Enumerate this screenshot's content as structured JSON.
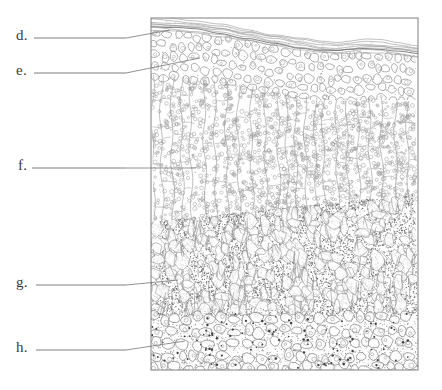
{
  "figure": {
    "background_color": "#ffffff",
    "frame": {
      "stroke_color": "#808080",
      "x": 151,
      "y": 18,
      "width": 267,
      "height": 352
    },
    "ink_color": "#8a8a8a",
    "dark_ink_color": "#555555",
    "label_color": "#3a3a3a"
  },
  "labels": [
    {
      "id": "d",
      "text": "d.",
      "text_x": 16,
      "text_y": 27,
      "rule_x1": 34,
      "rule_x2": 126,
      "rule_y": 38,
      "leader_x1": 126,
      "leader_y1": 38,
      "leader_x2": 170,
      "leader_y2": 30,
      "target": "cuticle-upper-epidermis"
    },
    {
      "id": "e",
      "text": "e.",
      "text_x": 16,
      "text_y": 62,
      "rule_x1": 34,
      "rule_x2": 126,
      "rule_y": 73,
      "leader_x1": 126,
      "leader_y1": 73,
      "leader_x2": 200,
      "leader_y2": 58,
      "target": "epidermis-cell"
    },
    {
      "id": "f",
      "text": "f.",
      "text_x": 18,
      "text_y": 157,
      "rule_x1": 32,
      "rule_x2": 126,
      "rule_y": 168,
      "leader_x1": 126,
      "leader_y1": 168,
      "leader_x2": 196,
      "leader_y2": 168,
      "target": "palisade-mesophyll"
    },
    {
      "id": "g",
      "text": "g.",
      "text_x": 16,
      "text_y": 274,
      "rule_x1": 36,
      "rule_x2": 126,
      "rule_y": 285,
      "leader_x1": 126,
      "leader_y1": 285,
      "leader_x2": 178,
      "leader_y2": 280,
      "target": "spongy-mesophyll"
    },
    {
      "id": "h",
      "text": "h.",
      "text_x": 16,
      "text_y": 339,
      "rule_x1": 36,
      "rule_x2": 126,
      "rule_y": 350,
      "leader_x1": 126,
      "leader_y1": 350,
      "leader_x2": 185,
      "leader_y2": 341,
      "target": "lower-epidermis"
    }
  ],
  "layers": [
    {
      "name": "cuticle",
      "top": 18,
      "bottom": 46,
      "style": "wavy-parallel-lines"
    },
    {
      "name": "upper-epidermis",
      "top": 34,
      "bottom": 92,
      "style": "round-cells"
    },
    {
      "name": "palisade-mesophyll",
      "top": 90,
      "bottom": 218,
      "style": "columnar-cells-with-chloroplasts"
    },
    {
      "name": "spongy-mesophyll",
      "top": 205,
      "bottom": 315,
      "style": "dense-stipple-irregular"
    },
    {
      "name": "lower-epidermis",
      "top": 312,
      "bottom": 370,
      "style": "round-cells-stippled"
    }
  ]
}
